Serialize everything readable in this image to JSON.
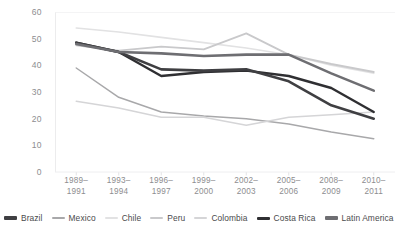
{
  "chart_data": {
    "type": "line",
    "title": "",
    "xlabel": "",
    "ylabel": "",
    "ylim": [
      0,
      60
    ],
    "ytick_step": 10,
    "grid": false,
    "legend_position": "bottom",
    "yticks": [
      "60",
      "50",
      "40",
      "30",
      "20",
      "10",
      "0"
    ],
    "categories": [
      "1989–\n1991",
      "1993–\n1994",
      "1996–\n1997",
      "1999–\n2000",
      "2002–\n2003",
      "2005–\n2006",
      "2008–\n2009",
      "2010–\n2011"
    ],
    "categories_line1": [
      "1989–",
      "1993–",
      "1996–",
      "1999–",
      "2002–",
      "2005–",
      "2008–",
      "2010–"
    ],
    "categories_line2": [
      "1991",
      "1994",
      "1997",
      "2000",
      "2003",
      "2006",
      "2009",
      "2011"
    ],
    "series": [
      {
        "name": "Brazil",
        "color": "#3f3f42",
        "width": 2.6,
        "values": [
          48.5,
          45.0,
          38.5,
          38.0,
          38.5,
          34.0,
          25.0,
          20.0
        ]
      },
      {
        "name": "Mexico",
        "color": "#a8a8aa",
        "width": 1.5,
        "values": [
          39.0,
          28.0,
          22.5,
          21.0,
          20.0,
          18.0,
          15.0,
          12.5
        ]
      },
      {
        "name": "Chile",
        "color": "#e2e2e3",
        "width": 1.6,
        "values": [
          54.0,
          52.5,
          50.5,
          48.5,
          46.5,
          44.0,
          40.0,
          37.0
        ]
      },
      {
        "name": "Peru",
        "color": "#c9c9cb",
        "width": 1.8,
        "values": [
          47.5,
          45.5,
          47.0,
          46.0,
          52.0,
          44.0,
          40.5,
          37.5
        ]
      },
      {
        "name": "Colombia",
        "color": "#d5d5d7",
        "width": 1.5,
        "values": [
          26.5,
          24.0,
          20.5,
          20.5,
          17.5,
          20.5,
          21.5,
          22.5
        ]
      },
      {
        "name": "Costa Rica",
        "color": "#2f2f32",
        "width": 2.4,
        "values": [
          48.5,
          45.0,
          36.0,
          37.5,
          38.0,
          36.0,
          31.5,
          22.5
        ]
      },
      {
        "name": "Latin America",
        "color": "#6e6e72",
        "width": 2.6,
        "values": [
          48.0,
          45.0,
          44.5,
          43.5,
          44.0,
          44.0,
          37.0,
          30.5
        ]
      }
    ]
  },
  "legend": {
    "items": [
      {
        "label": "Brazil",
        "color": "#3f3f42",
        "thickness": 3.2
      },
      {
        "label": "Mexico",
        "color": "#a8a8aa",
        "thickness": 1.8
      },
      {
        "label": "Chile",
        "color": "#e2e2e3",
        "thickness": 1.8
      },
      {
        "label": "Peru",
        "color": "#c9c9cb",
        "thickness": 2.2
      },
      {
        "label": "Colombia",
        "color": "#d5d5d7",
        "thickness": 1.8
      },
      {
        "label": "Costa Rica",
        "color": "#2f2f32",
        "thickness": 3.0
      },
      {
        "label": "Latin America",
        "color": "#6e6e72",
        "thickness": 3.4
      }
    ]
  }
}
